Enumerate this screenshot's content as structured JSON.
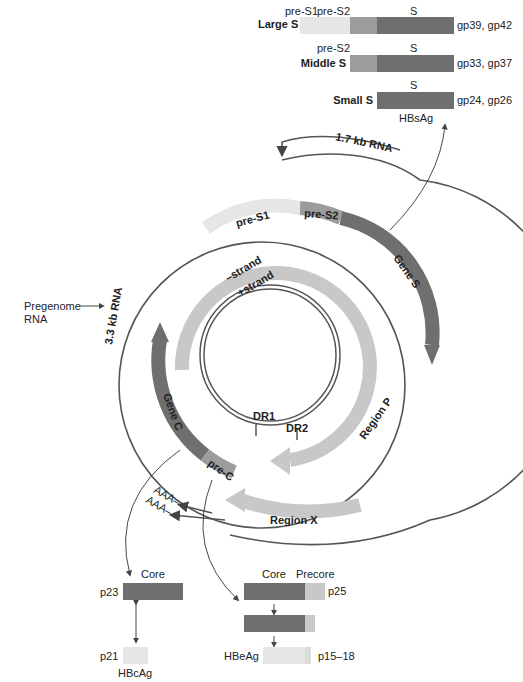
{
  "colors": {
    "dark": "#6f6f6f",
    "mid": "#9c9c9c",
    "light": "#c8c8c8",
    "pale": "#e6e6e6",
    "line": "#555555"
  },
  "proteins": {
    "large": {
      "label": "Large S",
      "seg1": "pre-S1",
      "seg2": "pre-S2",
      "seg3": "S",
      "right": "gp39, gp42"
    },
    "middle": {
      "label": "Middle S",
      "seg2": "pre-S2",
      "seg3": "S",
      "right": "gp33, gp37"
    },
    "small": {
      "label": "Small S",
      "seg3": "S",
      "right": "gp24, gp26"
    },
    "antigen": "HBsAg"
  },
  "genome": {
    "rna17": "1.7 kb RNA",
    "rna33": "3.3 kb RNA",
    "pregenome": "Pregenome",
    "pregenome2": "RNA",
    "preS1": "pre-S1",
    "preS2": "pre-S2",
    "geneS": "Gene S",
    "minus": "–strand",
    "plus": "+strand",
    "geneC": "Gene C",
    "preC": "pre-C",
    "regionP": "Region P",
    "regionX": "Region X",
    "dr1": "DR1",
    "dr2": "DR2",
    "aaa": "AAA–"
  },
  "core": {
    "core": "Core",
    "p23": "p23",
    "p21": "p21",
    "hbcag": "HBcAg"
  },
  "precore": {
    "core": "Core",
    "precore": "Precore",
    "p25": "p25",
    "hbeag": "HBeAg",
    "p1518": "p15–18"
  }
}
